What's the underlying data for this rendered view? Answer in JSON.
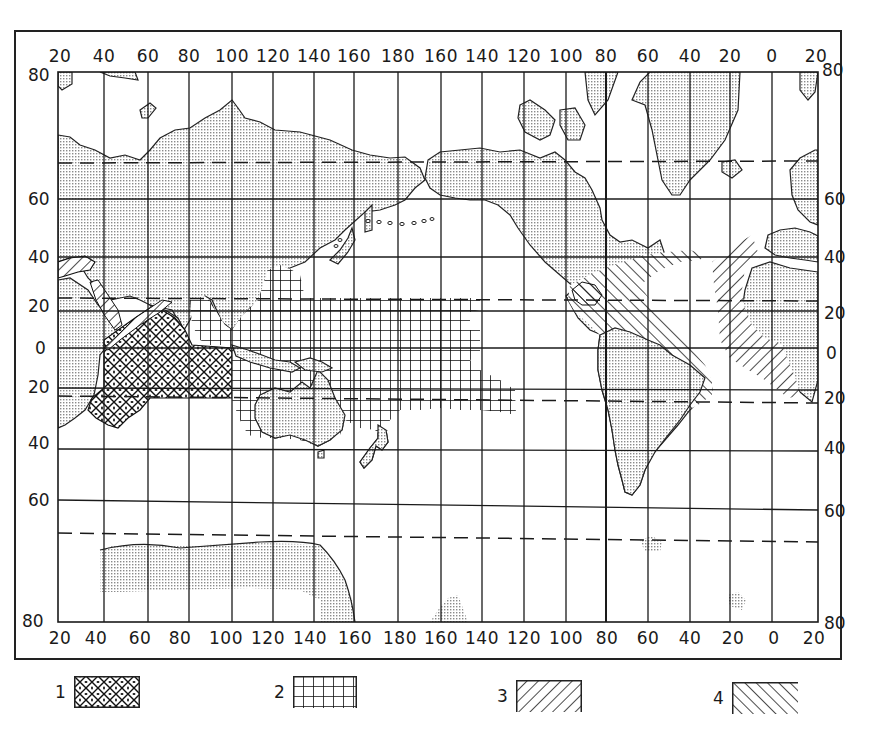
{
  "map": {
    "projection": "Mercator",
    "top_longitude_labels": [
      "20",
      "40",
      "60",
      "80",
      "100",
      "120",
      "140",
      "160",
      "180",
      "160",
      "140",
      "120",
      "100",
      "80",
      "60",
      "40",
      "20",
      "0",
      "20"
    ],
    "bottom_longitude_labels": [
      "20",
      "40",
      "60",
      "80",
      "100",
      "120",
      "140",
      "160",
      "180",
      "160",
      "140",
      "120",
      "100",
      "80",
      "60",
      "40",
      "20",
      "0",
      "20"
    ],
    "left_latitude_labels": [
      "80",
      "60",
      "40",
      "20",
      "0",
      "20",
      "40",
      "60",
      "80"
    ],
    "right_latitude_labels": [
      "80",
      "60",
      "40",
      "20",
      "0",
      "20",
      "40",
      "60",
      "80"
    ],
    "dashed_parallels": [
      "Arctic Circle (~66.5 N)",
      "Tropic of Cancer (~23.5 N)",
      "Tropic of Capricorn (~23.5 S)",
      "Antarctic Circle (~66.5 S)"
    ],
    "colors": {
      "ink": "#1a1a1a",
      "land_stipple": "#bdbdbd",
      "background": "#ffffff"
    }
  },
  "legend": {
    "items": [
      {
        "number": "1",
        "pattern": "diagonal cross-hatch with dots",
        "region": "Northern/western Indian Ocean"
      },
      {
        "number": "2",
        "pattern": "square grid",
        "region": "Western & central tropical Pacific"
      },
      {
        "number": "3",
        "pattern": "forward diagonal hatch (///)",
        "region": "Eastern Atlantic / West Africa, Mediterranean, Red Sea"
      },
      {
        "number": "4",
        "pattern": "backward diagonal hatch (\\\\\\)",
        "region": "Western tropical Atlantic / Caribbean"
      }
    ]
  }
}
